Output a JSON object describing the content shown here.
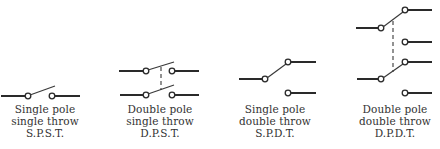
{
  "diagram": {
    "colors": {
      "line": "#2a2a2a",
      "text": "#333333",
      "background": "#ffffff"
    },
    "switches": [
      {
        "id": "spst",
        "name": "Single pole single throw",
        "caption": [
          "Single pole",
          "single throw",
          "S.P.S.T."
        ]
      },
      {
        "id": "dpst",
        "name": "Double pole single throw",
        "caption": [
          "Double pole",
          "single throw",
          "D.P.S.T."
        ]
      },
      {
        "id": "spdt",
        "name": "Single pole double throw",
        "caption": [
          "Single pole",
          "double throw",
          "S.P.D.T."
        ]
      },
      {
        "id": "dpdt",
        "name": "Double pole double throw",
        "caption": [
          "Double pole",
          "double throw",
          "D.P.D.T."
        ]
      }
    ]
  }
}
